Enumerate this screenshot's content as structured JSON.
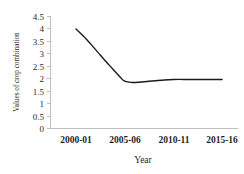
{
  "chart_data": {
    "type": "line",
    "title": "",
    "subtitle": "",
    "xlabel": "Year",
    "ylabel": "Values of crop combination",
    "categories": [
      "2000-01",
      "2005-06",
      "2010-11",
      "2015-16"
    ],
    "series": [
      {
        "name": "Values of crop combination",
        "values": [
          4.0,
          1.85,
          1.97,
          1.97
        ]
      }
    ],
    "dense_x": [
      0.0,
      0.15,
      0.3,
      0.45,
      0.6,
      0.75,
      0.9,
      1.0,
      1.15,
      1.3,
      1.5,
      1.75,
      2.0,
      2.35,
      2.7,
      3.0
    ],
    "dense_y": [
      4.0,
      3.72,
      3.4,
      3.06,
      2.72,
      2.4,
      2.08,
      1.9,
      1.85,
      1.86,
      1.9,
      1.94,
      1.97,
      1.97,
      1.97,
      1.97
    ],
    "ylim": [
      0,
      4.5
    ],
    "ytick_step": 0.5,
    "yticks": [
      "0",
      "0.5",
      "1",
      "1.5",
      "2",
      "2.5",
      "3",
      "3.5",
      "4",
      "4.5"
    ],
    "grid": false,
    "legend": false,
    "legend_position": "none",
    "line_color": "#1a1a1a",
    "axis_color": "#bfbfbf",
    "background_color": "#ffffff",
    "smooth": true,
    "markers": false
  },
  "axes": {
    "y_title": "Values of crop combination",
    "x_title": "Year"
  }
}
